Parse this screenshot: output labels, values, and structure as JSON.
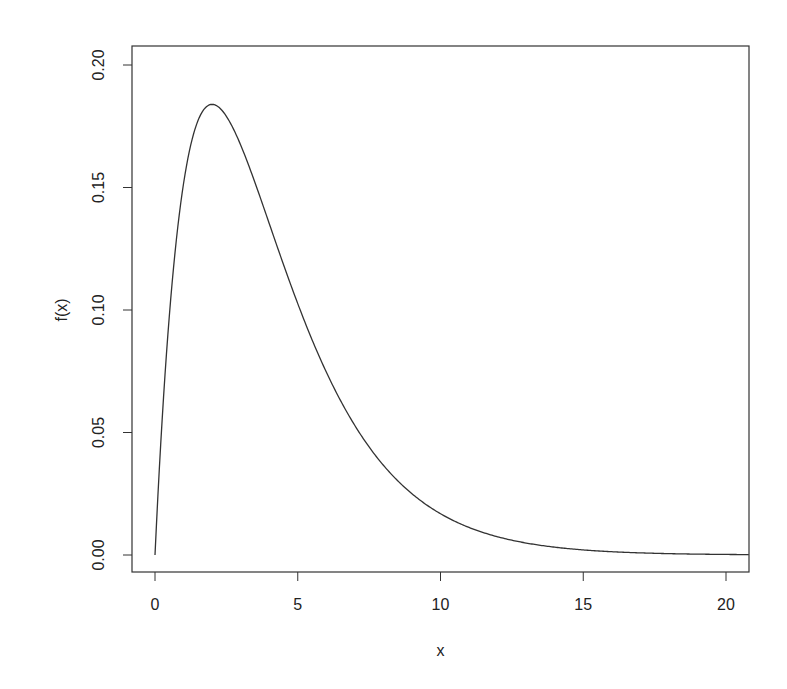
{
  "chart_data": {
    "type": "line",
    "title": "",
    "xlabel": "x",
    "ylabel": "f(x)",
    "xlim": [
      -0.8,
      20.8
    ],
    "ylim": [
      -0.0075,
      0.2075
    ],
    "x_ticks": [
      0,
      5,
      10,
      15,
      20
    ],
    "x_tick_labels": [
      "0",
      "5",
      "10",
      "15",
      "20"
    ],
    "y_ticks": [
      0.0,
      0.05,
      0.1,
      0.15,
      0.2
    ],
    "y_tick_labels": [
      "0.00",
      "0.05",
      "0.10",
      "0.15",
      "0.20"
    ],
    "grid": false,
    "legend": null,
    "series": [
      {
        "name": "f(x)",
        "description": "Chi-squared density, df = 4: f(x) = x * exp(-x/2) / 4",
        "color": "#333333",
        "x": [
          0,
          0.5,
          1,
          1.5,
          2,
          2.5,
          3,
          3.5,
          4,
          5,
          6,
          7,
          8,
          9,
          10,
          11,
          12,
          13,
          14,
          15,
          16,
          17,
          18,
          19,
          20,
          20.8
        ],
        "y": [
          0.0,
          0.0974,
          0.1516,
          0.1771,
          0.1839,
          0.1791,
          0.1673,
          0.1516,
          0.1353,
          0.1026,
          0.0747,
          0.0528,
          0.0366,
          0.025,
          0.0168,
          0.0113,
          0.0074,
          0.0049,
          0.0032,
          0.0021,
          0.0013,
          0.0009,
          0.0006,
          0.0004,
          0.0002,
          0.0002
        ]
      }
    ]
  },
  "layout": {
    "frame": {
      "left": 132,
      "top": 46,
      "right": 749,
      "bottom": 572
    },
    "x_px": {
      "at0": 155,
      "at20": 726
    },
    "y_px": {
      "at0": 555,
      "at020": 65
    }
  }
}
